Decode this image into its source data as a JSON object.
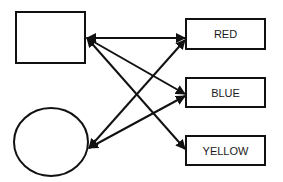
{
  "diagram": {
    "shapes": [
      {
        "id": "square",
        "type": "rect",
        "x": 16,
        "y": 12,
        "w": 69,
        "h": 51
      },
      {
        "id": "circle",
        "type": "ellipse",
        "cx": 51,
        "cy": 142,
        "rx": 37,
        "ry": 34
      }
    ],
    "boxes": [
      {
        "id": "red",
        "label": "RED",
        "x": 186,
        "y": 19,
        "w": 79,
        "h": 30
      },
      {
        "id": "blue",
        "label": "BLUE",
        "x": 186,
        "y": 78,
        "w": 79,
        "h": 29
      },
      {
        "id": "yellow",
        "label": "YELLOW",
        "x": 186,
        "y": 136,
        "w": 79,
        "h": 29
      }
    ],
    "edges": [
      {
        "from": "square",
        "to": "red",
        "bidirectional": true
      },
      {
        "from": "square",
        "to": "blue",
        "bidirectional": true
      },
      {
        "from": "square",
        "to": "yellow",
        "bidirectional": true
      },
      {
        "from": "circle",
        "to": "red",
        "bidirectional": true
      },
      {
        "from": "circle",
        "to": "blue",
        "bidirectional": true
      }
    ],
    "colors": {
      "stroke": "#111111",
      "background": "#ffffff"
    }
  }
}
